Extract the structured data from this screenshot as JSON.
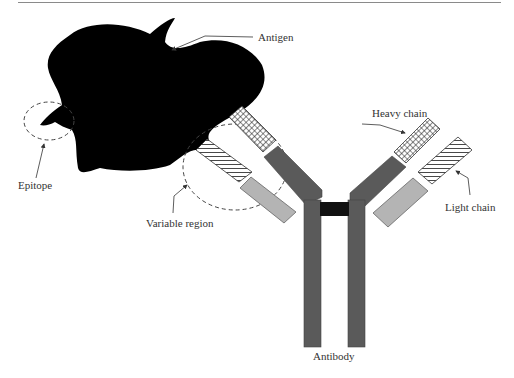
{
  "figure": {
    "type": "antibody-antigen diagram",
    "labels": {
      "antigen": "Antigen",
      "epitope": "Epitope",
      "variable_region": "Variable region",
      "heavy_chain": "Heavy chain",
      "light_chain": "Light chain",
      "antibody": "Antibody"
    },
    "colors": {
      "antigen": "#000000",
      "heavy_constant": "#5a5a5a",
      "light_constant": "#b4b4b4",
      "hinge": "#111111",
      "background": "#ffffff",
      "label_text": "#333333"
    }
  }
}
